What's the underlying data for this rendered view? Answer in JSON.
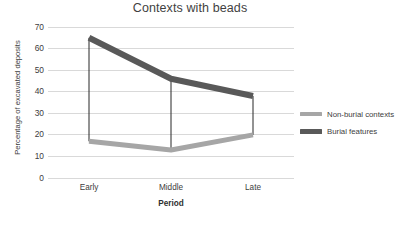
{
  "chart_data": {
    "type": "line",
    "title": "Contexts with beads",
    "xlabel": "Period",
    "ylabel": "Percentage of excavated deposits",
    "categories": [
      "Early",
      "Middle",
      "Late"
    ],
    "ylim": [
      0,
      70
    ],
    "yticks": [
      0,
      10,
      20,
      30,
      40,
      50,
      60,
      70
    ],
    "ytick_labels": [
      "0",
      "10",
      "20",
      "30",
      "40",
      "50",
      "60",
      "70"
    ],
    "grid": true,
    "legend_position": "right",
    "series": [
      {
        "name": "Non-burial contexts",
        "values": [
          17,
          13,
          20
        ],
        "color": "#a6a6a6",
        "line_width": 5
      },
      {
        "name": "Burial features",
        "values": [
          65,
          46,
          38
        ],
        "color": "#595959",
        "line_width": 6
      }
    ],
    "connectors": {
      "name": "vertical range connectors",
      "color": "#262626",
      "line_width": 1,
      "pairs": [
        [
          17,
          65
        ],
        [
          13,
          46
        ],
        [
          20,
          38
        ]
      ]
    },
    "colors": {
      "grid": "#d9d9d9",
      "text": "#404040",
      "title": "#3f3f3f",
      "background": "#ffffff"
    }
  }
}
